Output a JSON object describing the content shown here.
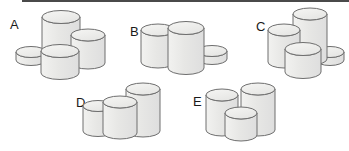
{
  "figure": {
    "width": 349,
    "height": 151,
    "background": "#ffffff",
    "top_rule": {
      "color": "#4a4a4a",
      "x": 22,
      "y": 0,
      "width": 327,
      "height": 2
    },
    "style": {
      "cylinder_fill": "#e9e9e7",
      "cylinder_top_fill": "#efefed",
      "outline": "#6e6e6e",
      "outline_width": 1,
      "label_color": "#1a1a1a"
    }
  },
  "panels": [
    {
      "id": "A",
      "label": "A",
      "label_x": 10,
      "label_y": 18,
      "origin_x": 0,
      "origin_y": 0,
      "cylinders": [
        {
          "name": "flat-disc",
          "cx": 31,
          "cy": 52,
          "rx": 15,
          "ry": 5.5,
          "height": 8,
          "order": 1
        },
        {
          "name": "tall-cylinder",
          "cx": 61,
          "cy": 17,
          "rx": 19,
          "ry": 6.5,
          "height": 43,
          "order": 2
        },
        {
          "name": "medium-cylinder",
          "cx": 88,
          "cy": 35,
          "rx": 17,
          "ry": 6,
          "height": 28,
          "order": 3
        },
        {
          "name": "short-wide-cylinder",
          "cx": 60,
          "cy": 51,
          "rx": 19,
          "ry": 6.5,
          "height": 22,
          "order": 4
        }
      ]
    },
    {
      "id": "B",
      "label": "B",
      "label_x": 130,
      "label_y": 25,
      "origin_x": 0,
      "origin_y": 0,
      "cylinders": [
        {
          "name": "flat-disc",
          "cx": 212,
          "cy": 51,
          "rx": 15,
          "ry": 5.5,
          "height": 8,
          "order": 1
        },
        {
          "name": "left-cylinder",
          "cx": 158,
          "cy": 30,
          "rx": 17,
          "ry": 6,
          "height": 32,
          "order": 2
        },
        {
          "name": "right-cylinder",
          "cx": 186,
          "cy": 28,
          "rx": 18,
          "ry": 6.5,
          "height": 40,
          "order": 3
        }
      ]
    },
    {
      "id": "C",
      "label": "C",
      "label_x": 256,
      "label_y": 20,
      "origin_x": 0,
      "origin_y": 0,
      "cylinders": [
        {
          "name": "flat-disc",
          "cx": 330,
          "cy": 52,
          "rx": 14,
          "ry": 5.5,
          "height": 8,
          "order": 1
        },
        {
          "name": "tall-cylinder",
          "cx": 310,
          "cy": 14,
          "rx": 17,
          "ry": 6,
          "height": 45,
          "order": 2
        },
        {
          "name": "medium-cylinder",
          "cx": 284,
          "cy": 30,
          "rx": 16,
          "ry": 6,
          "height": 32,
          "order": 3
        },
        {
          "name": "short-wide-cylinder",
          "cx": 303,
          "cy": 49,
          "rx": 18,
          "ry": 6.5,
          "height": 23,
          "order": 4
        }
      ]
    },
    {
      "id": "D",
      "label": "D",
      "label_x": 76,
      "label_y": 96,
      "origin_x": 0,
      "origin_y": 0,
      "cylinders": [
        {
          "name": "tall-cylinder",
          "cx": 143,
          "cy": 89,
          "rx": 17,
          "ry": 6,
          "height": 42,
          "order": 1
        },
        {
          "name": "left-cylinder",
          "cx": 98,
          "cy": 106,
          "rx": 15,
          "ry": 5.5,
          "height": 25,
          "order": 2
        },
        {
          "name": "center-cylinder",
          "cx": 120,
          "cy": 102,
          "rx": 17,
          "ry": 6,
          "height": 31,
          "order": 3
        }
      ]
    },
    {
      "id": "E",
      "label": "E",
      "label_x": 193,
      "label_y": 95,
      "origin_x": 0,
      "origin_y": 0,
      "cylinders": [
        {
          "name": "right-tall-cylinder",
          "cx": 258,
          "cy": 89,
          "rx": 17,
          "ry": 6,
          "height": 41,
          "order": 1
        },
        {
          "name": "left-cylinder",
          "cx": 222,
          "cy": 95,
          "rx": 16,
          "ry": 6,
          "height": 35,
          "order": 2
        },
        {
          "name": "front-short-cylinder",
          "cx": 241,
          "cy": 113,
          "rx": 16,
          "ry": 6,
          "height": 22,
          "order": 3
        }
      ]
    }
  ]
}
